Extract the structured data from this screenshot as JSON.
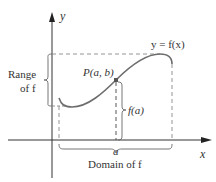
{
  "diagram": {
    "type": "function-graph",
    "axes": {
      "x_label": "x",
      "y_label": "y"
    },
    "curve": {
      "label": "y = f(x)",
      "color": "#6d6d6d"
    },
    "point": {
      "label": "P(a, b)"
    },
    "labels": {
      "range_line1": "Range",
      "range_line2": "of f",
      "f_of_a": "f(a)",
      "a_tick": "a",
      "domain": "Domain of f"
    },
    "colors": {
      "axis": "#333333",
      "dashed": "#888888",
      "curve": "#6d6d6d",
      "text": "#333333"
    }
  }
}
